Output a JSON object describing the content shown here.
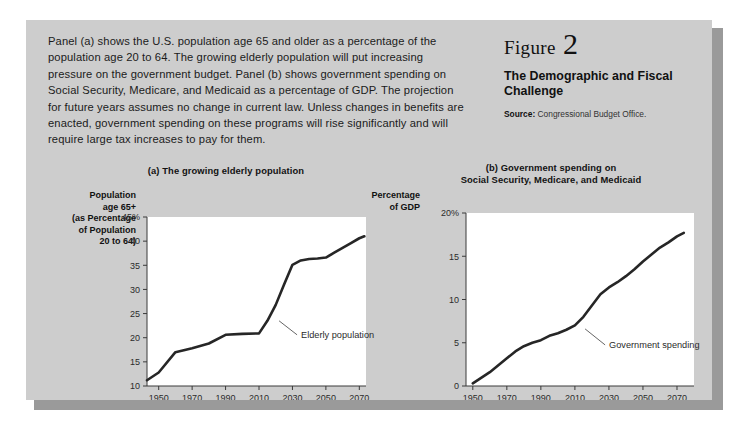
{
  "figure": {
    "caption": "Panel (a) shows the U.S. population age 65 and older as a percentage of the population age 20 to 64. The growing elderly population will put increasing pressure on the government budget. Panel (b) shows government spending on Social Security, Medicare, and Medicaid as a percentage of GDP. The projection for future years assumes no change in current law. Unless changes in benefits are enacted, government spending on these programs will rise significantly and will require large tax increases to pay for them.",
    "figure_word": "Figure",
    "figure_number": "2",
    "title": "The Demographic and Fiscal Challenge",
    "source_label": "Source:",
    "source_text": "Congressional Budget Office.",
    "colors": {
      "card_background": "#cdcdcd",
      "plot_background": "#ffffff",
      "shadow": "#9a9a9a",
      "line": "#262626",
      "axis": "#3a3a3a",
      "text": "#111111"
    }
  },
  "chart_data": [
    {
      "type": "line",
      "panel": "a",
      "title": "(a) The growing elderly population",
      "ylabel": "Population age 65+ (as Percentage of Population 20 to 64)",
      "ylabel_lines": [
        "Population",
        "age 65+",
        "(as Percentage",
        "of Population",
        "20 to 64)"
      ],
      "xlabel": "",
      "ylim": [
        10,
        45
      ],
      "xlim": [
        1943,
        2074
      ],
      "yticks": [
        10,
        15,
        20,
        25,
        30,
        35,
        40,
        45
      ],
      "ytick_labels": [
        "10",
        "15",
        "20",
        "25",
        "30",
        "35",
        "40",
        "45%"
      ],
      "xticks": [
        1950,
        1970,
        1990,
        2010,
        2030,
        2050,
        2070
      ],
      "xtick_labels": [
        "1950",
        "1970",
        "1990",
        "2010",
        "2030",
        "2050",
        "2070"
      ],
      "grid": false,
      "legend": "none",
      "annotations": [
        {
          "text": "Elderly population",
          "x": 2022,
          "y": 23.5
        }
      ],
      "series": [
        {
          "name": "Elderly population",
          "x": [
            1943,
            1950,
            1960,
            1970,
            1980,
            1990,
            2000,
            2010,
            2015,
            2020,
            2025,
            2030,
            2035,
            2040,
            2045,
            2050,
            2055,
            2060,
            2065,
            2070,
            2073
          ],
          "values": [
            11.2,
            12.8,
            17.0,
            17.8,
            18.8,
            20.6,
            20.8,
            20.9,
            23.5,
            26.8,
            31.0,
            35.1,
            36.0,
            36.3,
            36.4,
            36.6,
            37.6,
            38.6,
            39.6,
            40.6,
            41.0
          ]
        }
      ]
    },
    {
      "type": "line",
      "panel": "b",
      "title": "(b) Government spending on Social Security, Medicare, and Medicaid",
      "title_lines": [
        "(b) Government spending on",
        "Social Security, Medicare, and Medicaid"
      ],
      "ylabel": "Percentage of GDP",
      "ylabel_lines": [
        "Percentage",
        "of GDP"
      ],
      "xlabel": "",
      "ylim": [
        0,
        20
      ],
      "xlim": [
        1946,
        2080
      ],
      "yticks": [
        0,
        5,
        10,
        15,
        20
      ],
      "ytick_labels": [
        "0",
        "5",
        "10",
        "15",
        "20%"
      ],
      "xticks": [
        1950,
        1970,
        1990,
        2010,
        2030,
        2050,
        2070
      ],
      "xtick_labels": [
        "1950",
        "1970",
        "1990",
        "2010",
        "2030",
        "2050",
        "2070"
      ],
      "grid": false,
      "legend": "none",
      "annotations": [
        {
          "text": "Government spending",
          "x": 2016,
          "y": 6.6
        }
      ],
      "series": [
        {
          "name": "Government spending",
          "x": [
            1950,
            1960,
            1970,
            1975,
            1980,
            1985,
            1990,
            1995,
            2000,
            2005,
            2010,
            2015,
            2020,
            2025,
            2030,
            2035,
            2040,
            2045,
            2050,
            2055,
            2060,
            2065,
            2070,
            2074
          ],
          "values": [
            0.3,
            1.6,
            3.2,
            4.0,
            4.6,
            5.0,
            5.3,
            5.8,
            6.1,
            6.5,
            7.0,
            8.0,
            9.3,
            10.6,
            11.4,
            12.0,
            12.7,
            13.5,
            14.4,
            15.2,
            16.0,
            16.6,
            17.3,
            17.7
          ]
        }
      ]
    }
  ]
}
